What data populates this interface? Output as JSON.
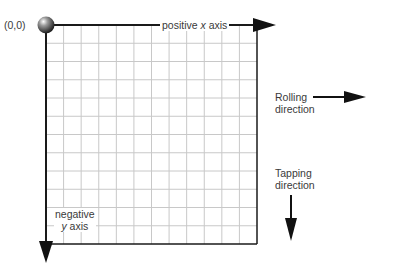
{
  "diagram": {
    "origin_label": "(0,0)",
    "x_axis": {
      "prefix": "positive ",
      "var": "x",
      "suffix": " axis"
    },
    "y_axis": {
      "line1": "negative",
      "line2_var": "y",
      "line2_suffix": " axis"
    },
    "rolling": {
      "line1": "Rolling",
      "line2": "direction"
    },
    "tapping": {
      "line1": "Tapping",
      "line2": "direction"
    },
    "grid": {
      "columns": 12,
      "rows": 12
    },
    "colors": {
      "axis": "#1a1a1a",
      "grid": "#c8c8c8",
      "text": "#3a3a3a",
      "ball": "#555555"
    }
  }
}
